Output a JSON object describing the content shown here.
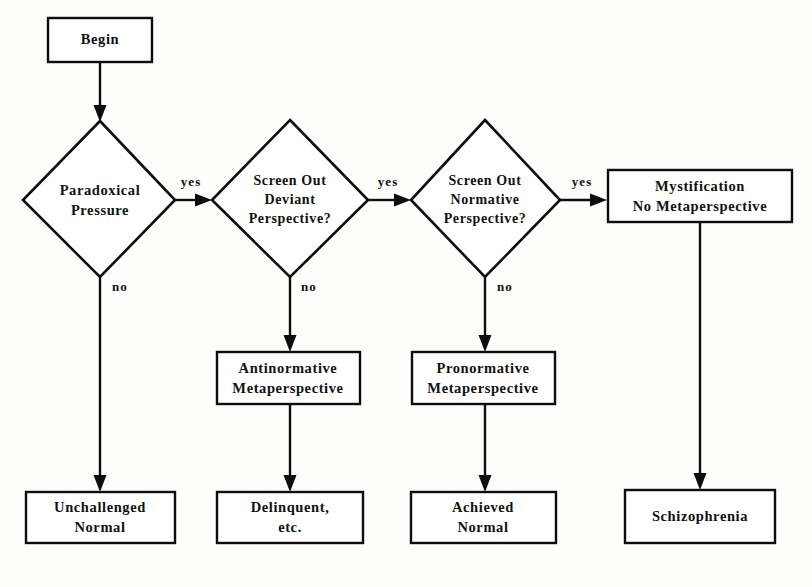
{
  "diagram": {
    "background_color": "#fdfdfc",
    "line_color": "#0d0d0d",
    "fill_color": "#ffffff",
    "nodes": {
      "begin": {
        "label": "Begin",
        "shape": "rectangle"
      },
      "paradoxical_pressure": {
        "line1": "Paradoxical",
        "line2": "Pressure",
        "shape": "diamond"
      },
      "screen_deviant": {
        "line1": "Screen Out",
        "line2": "Deviant",
        "line3": "Perspective?",
        "shape": "diamond"
      },
      "screen_normative": {
        "line1": "Screen Out",
        "line2": "Normative",
        "line3": "Perspective?",
        "shape": "diamond"
      },
      "mystification": {
        "line1": "Mystification",
        "line2": "No  Metaperspective",
        "shape": "rectangle"
      },
      "antinormative": {
        "line1": "Antinormative",
        "line2": "Metaperspective",
        "shape": "rectangle"
      },
      "pronormative": {
        "line1": "Pronormative",
        "line2": "Metaperspective",
        "shape": "rectangle"
      },
      "unchallenged_normal": {
        "line1": "Unchallenged",
        "line2": "Normal",
        "shape": "rectangle"
      },
      "delinquent": {
        "line1": "Delinquent,",
        "line2": "etc.",
        "shape": "rectangle"
      },
      "achieved_normal": {
        "line1": "Achieved",
        "line2": "Normal",
        "shape": "rectangle"
      },
      "schizophrenia": {
        "line1": "Schizophrenia",
        "shape": "rectangle"
      }
    },
    "edge_labels": {
      "yes_1": "yes",
      "yes_2": "yes",
      "yes_3": "yes",
      "no_1": "no",
      "no_2": "no",
      "no_3": "no"
    }
  }
}
